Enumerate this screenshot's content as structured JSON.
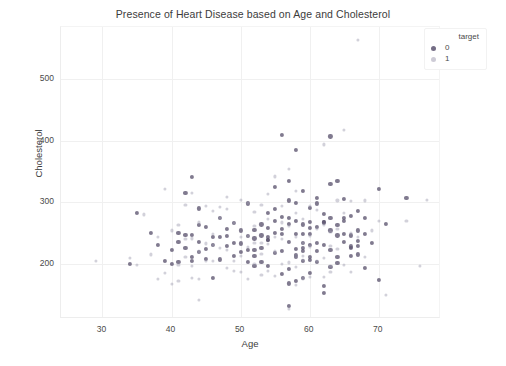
{
  "chart_data": {
    "type": "scatter",
    "title": "Presence of Heart Disease based on Age and Cholesterol",
    "xlabel": "Age",
    "ylabel": "Cholesterol",
    "xlim": [
      24,
      79
    ],
    "ylim": [
      110,
      585
    ],
    "xticks": [
      30,
      40,
      50,
      60,
      70
    ],
    "yticks": [
      200,
      300,
      400,
      500
    ],
    "grid": true,
    "legend": {
      "title": "target",
      "position": "upper right outside",
      "entries": [
        {
          "label": "0",
          "color": "#5c5470"
        },
        {
          "label": "1",
          "color": "#9b98ae"
        }
      ]
    },
    "series": [
      {
        "name": "0",
        "color": "#5c5470",
        "points": [
          [
            34,
            200
          ],
          [
            35,
            282
          ],
          [
            37,
            250
          ],
          [
            38,
            231
          ],
          [
            39,
            204
          ],
          [
            40,
            223
          ],
          [
            40,
            199
          ],
          [
            41,
            235
          ],
          [
            41,
            250
          ],
          [
            42,
            226
          ],
          [
            42,
            315
          ],
          [
            42,
            247
          ],
          [
            43,
            247
          ],
          [
            43,
            341
          ],
          [
            43,
            211
          ],
          [
            44,
            263
          ],
          [
            44,
            235
          ],
          [
            45,
            224
          ],
          [
            45,
            208
          ],
          [
            46,
            243
          ],
          [
            46,
            230
          ],
          [
            47,
            243
          ],
          [
            47,
            207
          ],
          [
            48,
            229
          ],
          [
            48,
            245
          ],
          [
            49,
            266
          ],
          [
            49,
            212
          ],
          [
            50,
            233
          ],
          [
            50,
            219
          ],
          [
            51,
            222
          ],
          [
            51,
            298
          ],
          [
            51,
            203
          ],
          [
            52,
            196
          ],
          [
            52,
            255
          ],
          [
            52,
            223
          ],
          [
            53,
            203
          ],
          [
            53,
            246
          ],
          [
            54,
            239
          ],
          [
            54,
            258
          ],
          [
            54,
            283
          ],
          [
            54,
            196
          ],
          [
            54,
            239
          ],
          [
            55,
            217
          ],
          [
            55,
            270
          ],
          [
            55,
            325
          ],
          [
            56,
            184
          ],
          [
            56,
            256
          ],
          [
            56,
            409
          ],
          [
            56,
            249
          ],
          [
            57,
            236
          ],
          [
            57,
            192
          ],
          [
            57,
            168
          ],
          [
            57,
            274
          ],
          [
            57,
            303
          ],
          [
            57,
            131
          ],
          [
            58,
            211
          ],
          [
            58,
            270
          ],
          [
            58,
            224
          ],
          [
            58,
            214
          ],
          [
            58,
            248
          ],
          [
            58,
            172
          ],
          [
            59,
            234
          ],
          [
            59,
            264
          ],
          [
            59,
            204
          ],
          [
            59,
            318
          ],
          [
            59,
            226
          ],
          [
            59,
            221
          ],
          [
            60,
            211
          ],
          [
            60,
            206
          ],
          [
            60,
            248
          ],
          [
            60,
            258
          ],
          [
            60,
            185
          ],
          [
            61,
            203
          ],
          [
            61,
            260
          ],
          [
            61,
            307
          ],
          [
            61,
            298
          ],
          [
            62,
            267
          ],
          [
            62,
            268
          ],
          [
            62,
            164
          ],
          [
            62,
            281
          ],
          [
            63,
            254
          ],
          [
            63,
            223
          ],
          [
            63,
            195
          ],
          [
            63,
            330
          ],
          [
            64,
            246
          ],
          [
            64,
            335
          ],
          [
            64,
            211
          ],
          [
            64,
            263
          ],
          [
            65,
            269
          ],
          [
            65,
            305
          ],
          [
            65,
            275
          ],
          [
            66,
            228
          ],
          [
            66,
            226
          ],
          [
            66,
            246
          ],
          [
            67,
            229
          ],
          [
            67,
            237
          ],
          [
            67,
            286
          ],
          [
            67,
            254
          ],
          [
            68,
            274
          ],
          [
            68,
            193
          ],
          [
            69,
            234
          ],
          [
            70,
            174
          ],
          [
            70,
            322
          ],
          [
            71,
            265
          ],
          [
            74,
            307
          ],
          [
            60,
            291
          ],
          [
            55,
            289
          ],
          [
            59,
            177
          ],
          [
            62,
            152
          ],
          [
            63,
            407
          ],
          [
            58,
            385
          ],
          [
            57,
            335
          ],
          [
            56,
            276
          ],
          [
            53,
            226
          ],
          [
            50,
            254
          ],
          [
            48,
            256
          ],
          [
            44,
            290
          ],
          [
            46,
            177
          ],
          [
            52,
            241
          ],
          [
            61,
            221
          ],
          [
            65,
            236
          ],
          [
            66,
            278
          ],
          [
            54,
            244
          ],
          [
            49,
            234
          ],
          [
            45,
            260
          ],
          [
            43,
            204
          ],
          [
            58,
            299
          ],
          [
            60,
            231
          ],
          [
            62,
            231
          ],
          [
            64,
            201
          ],
          [
            51,
            245
          ],
          [
            53,
            264
          ],
          [
            55,
            250
          ],
          [
            57,
            265
          ],
          [
            59,
            249
          ],
          [
            61,
            234
          ],
          [
            63,
            275
          ],
          [
            65,
            248
          ],
          [
            56,
            221
          ],
          [
            52,
            212
          ],
          [
            66,
            213
          ],
          [
            67,
            215
          ],
          [
            68,
            249
          ],
          [
            44,
            219
          ],
          [
            47,
            275
          ],
          [
            41,
            203
          ],
          [
            60,
            268
          ]
        ]
      },
      {
        "name": "1",
        "color": "#9b98ae",
        "points": [
          [
            29,
            204
          ],
          [
            34,
            210
          ],
          [
            35,
            198
          ],
          [
            37,
            215
          ],
          [
            38,
            175
          ],
          [
            39,
            321
          ],
          [
            40,
            167
          ],
          [
            41,
            198
          ],
          [
            41,
            172
          ],
          [
            42,
            240
          ],
          [
            42,
            211
          ],
          [
            43,
            177
          ],
          [
            43,
            315
          ],
          [
            44,
            220
          ],
          [
            44,
            141
          ],
          [
            45,
            233
          ],
          [
            46,
            249
          ],
          [
            46,
            204
          ],
          [
            47,
            275
          ],
          [
            48,
            193
          ],
          [
            48,
            308
          ],
          [
            49,
            188
          ],
          [
            50,
            243
          ],
          [
            50,
            212
          ],
          [
            51,
            227
          ],
          [
            51,
            245
          ],
          [
            52,
            199
          ],
          [
            52,
            284
          ],
          [
            53,
            182
          ],
          [
            53,
            216
          ],
          [
            54,
            232
          ],
          [
            54,
            273
          ],
          [
            55,
            220
          ],
          [
            55,
            342
          ],
          [
            56,
            240
          ],
          [
            56,
            294
          ],
          [
            57,
            126
          ],
          [
            57,
            354
          ],
          [
            58,
            283
          ],
          [
            58,
            213
          ],
          [
            58,
            319
          ],
          [
            59,
            212
          ],
          [
            59,
            176
          ],
          [
            59,
            273
          ],
          [
            60,
            178
          ],
          [
            60,
            228
          ],
          [
            61,
            204
          ],
          [
            62,
            209
          ],
          [
            62,
            394
          ],
          [
            63,
            187
          ],
          [
            63,
            252
          ],
          [
            64,
            303
          ],
          [
            65,
            282
          ],
          [
            65,
            417
          ],
          [
            66,
            302
          ],
          [
            67,
            564
          ],
          [
            68,
            211
          ],
          [
            69,
            254
          ],
          [
            70,
            269
          ],
          [
            71,
            149
          ],
          [
            74,
            269
          ],
          [
            76,
            197
          ],
          [
            77,
            304
          ],
          [
            42,
            295
          ],
          [
            45,
            204
          ],
          [
            47,
            226
          ],
          [
            49,
            266
          ],
          [
            51,
            175
          ],
          [
            53,
            295
          ],
          [
            55,
            180
          ],
          [
            57,
            261
          ],
          [
            59,
            234
          ],
          [
            61,
            288
          ],
          [
            63,
            229
          ],
          [
            65,
            198
          ],
          [
            44,
            267
          ],
          [
            46,
            231
          ],
          [
            48,
            289
          ],
          [
            50,
            186
          ],
          [
            52,
            234
          ],
          [
            54,
            188
          ],
          [
            56,
            267
          ],
          [
            58,
            244
          ],
          [
            60,
            294
          ],
          [
            62,
            178
          ],
          [
            64,
            224
          ],
          [
            66,
            186
          ],
          [
            39,
            185
          ],
          [
            41,
            263
          ],
          [
            43,
            196
          ],
          [
            45,
            294
          ],
          [
            67,
            243
          ],
          [
            68,
            303
          ],
          [
            62,
            263
          ],
          [
            60,
            245
          ],
          [
            58,
            195
          ],
          [
            56,
            200
          ],
          [
            54,
            313
          ],
          [
            52,
            262
          ],
          [
            50,
            304
          ],
          [
            48,
            222
          ],
          [
            46,
            286
          ],
          [
            57,
            202
          ],
          [
            61,
            256
          ],
          [
            59,
            206
          ],
          [
            64,
            256
          ],
          [
            53,
            234
          ],
          [
            51,
            299
          ],
          [
            49,
            204
          ],
          [
            55,
            244
          ],
          [
            63,
            197
          ],
          [
            66,
            250
          ],
          [
            44,
            175
          ],
          [
            47,
            292
          ],
          [
            43,
            241
          ],
          [
            40,
            254
          ],
          [
            38,
            244
          ],
          [
            36,
            280
          ],
          [
            58,
            165
          ]
        ]
      }
    ]
  }
}
